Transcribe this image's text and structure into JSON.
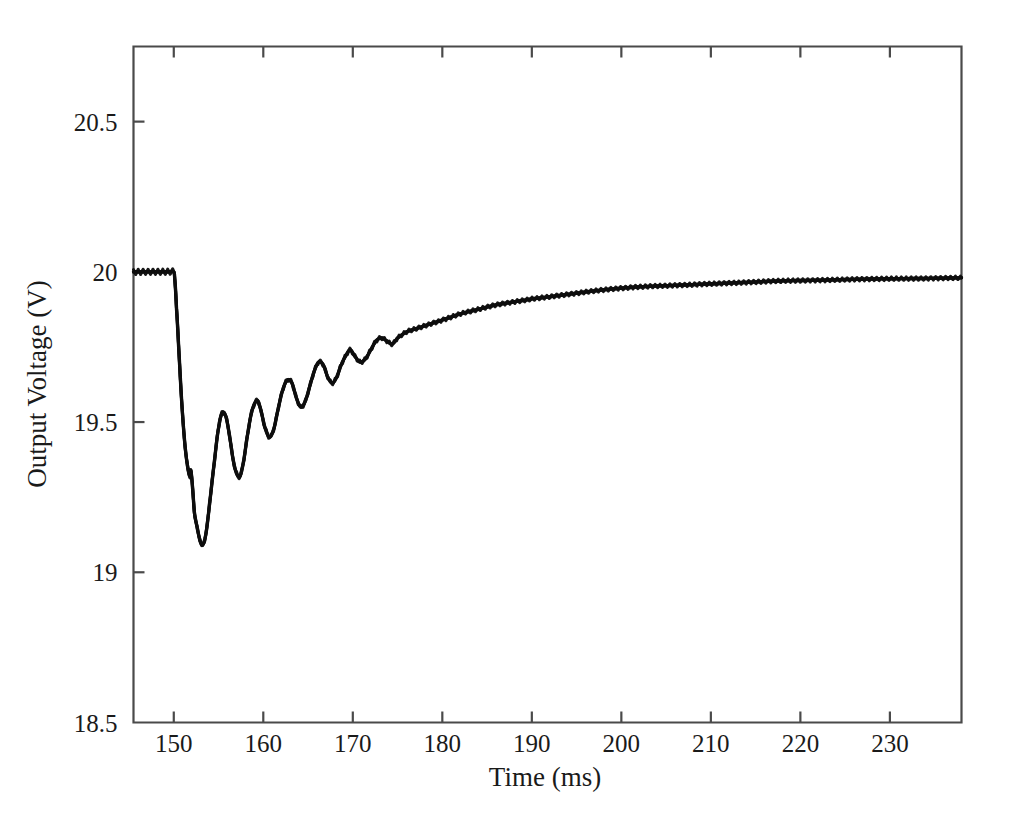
{
  "chart_data": {
    "type": "line",
    "title": "",
    "xlabel": "Time (ms)",
    "ylabel": "Output Voltage (V)",
    "xlim": [
      145.5,
      238.0
    ],
    "ylim": [
      18.5,
      20.75
    ],
    "xticks": [
      150,
      160,
      170,
      180,
      190,
      200,
      210,
      220,
      230
    ],
    "xtick_labels": [
      "150",
      "160",
      "170",
      "180",
      "190",
      "200",
      "210",
      "220",
      "230"
    ],
    "yticks": [
      18.5,
      19,
      19.5,
      20,
      20.5
    ],
    "ytick_labels": [
      "18.5",
      "19",
      "19.5",
      "20",
      "20.5"
    ],
    "grid": false,
    "legend": null,
    "line_color": "#0d0d0d",
    "axis_color": "#4a4a4a",
    "series": [
      {
        "name": "Output Voltage",
        "x": [
          145.5,
          146.5,
          147.5,
          148.5,
          149.5,
          150.0,
          150.1,
          150.3,
          150.6,
          150.9,
          151.2,
          151.5,
          151.8,
          151.9,
          152.1,
          152.3,
          152.6,
          152.9,
          153.2,
          153.6,
          154.0,
          154.5,
          155.0,
          155.4,
          155.8,
          156.2,
          156.6,
          157.0,
          157.4,
          157.8,
          158.2,
          158.6,
          159.0,
          159.4,
          159.8,
          160.2,
          160.7,
          161.2,
          161.7,
          162.2,
          162.7,
          163.2,
          163.7,
          164.2,
          164.7,
          165.2,
          165.7,
          166.2,
          166.7,
          167.2,
          167.7,
          168.2,
          168.7,
          169.2,
          169.7,
          170.2,
          170.8,
          171.4,
          172.0,
          172.6,
          173.2,
          173.8,
          174.4,
          175.0,
          176.0,
          177.0,
          178.0,
          179.0,
          180.0,
          182.0,
          184.0,
          186.0,
          188.0,
          190.0,
          194.0,
          198.0,
          202.0,
          206.0,
          210.0,
          214.0,
          218.0,
          222.0,
          226.0,
          230.0,
          234.0,
          238.0
        ],
        "y": [
          20.0,
          20.0,
          20.0,
          20.0,
          20.0,
          20.0,
          19.98,
          19.88,
          19.72,
          19.56,
          19.44,
          19.36,
          19.32,
          19.34,
          19.28,
          19.2,
          19.15,
          19.11,
          19.09,
          19.13,
          19.23,
          19.36,
          19.48,
          19.53,
          19.52,
          19.46,
          19.38,
          19.33,
          19.32,
          19.37,
          19.45,
          19.52,
          19.56,
          19.57,
          19.53,
          19.48,
          19.45,
          19.48,
          19.55,
          19.61,
          19.64,
          19.63,
          19.58,
          19.55,
          19.57,
          19.62,
          19.67,
          19.7,
          19.69,
          19.65,
          19.63,
          19.65,
          19.69,
          19.72,
          19.74,
          19.72,
          19.7,
          19.71,
          19.74,
          19.77,
          19.78,
          19.77,
          19.76,
          19.78,
          19.8,
          19.81,
          19.82,
          19.83,
          19.84,
          19.86,
          19.875,
          19.89,
          19.9,
          19.91,
          19.925,
          19.94,
          19.95,
          19.955,
          19.96,
          19.965,
          19.97,
          19.972,
          19.975,
          19.977,
          19.978,
          19.98
        ]
      }
    ],
    "ripple": {
      "pre_step_amplitude_V": 0.018,
      "post_step_amplitude_V": 0.012,
      "switching_period_ms": 0.55
    },
    "oscillation": {
      "ring_period_ms": 3.0,
      "undershoot_min_V": 19.09,
      "undershoot_time_ms": 153.2,
      "step_time_ms": 150.0,
      "settling_value_V": 19.98
    }
  },
  "axes": {
    "x_axis_title": "Time (ms)",
    "y_axis_title": "Output Voltage (V)"
  }
}
